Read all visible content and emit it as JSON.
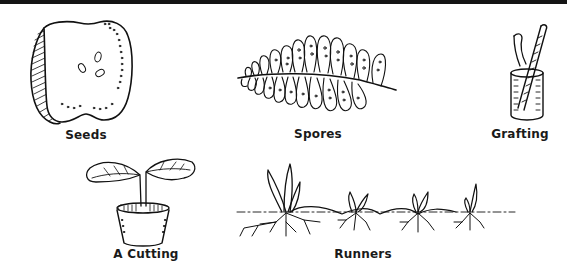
{
  "figure": {
    "panels": [
      {
        "id": "seeds",
        "label": "Seeds",
        "icon": "apple-half-icon"
      },
      {
        "id": "spores",
        "label": "Spores",
        "icon": "fern-frond-icon"
      },
      {
        "id": "grafting",
        "label": "Grafting",
        "icon": "graft-stem-icon"
      },
      {
        "id": "cutting",
        "label": "A Cutting",
        "icon": "potted-cutting-icon"
      },
      {
        "id": "runners",
        "label": "Runners",
        "icon": "runner-plants-icon"
      }
    ]
  },
  "colors": {
    "ink": "#111111",
    "background": "#ffffff",
    "top_bar": "#151515"
  }
}
